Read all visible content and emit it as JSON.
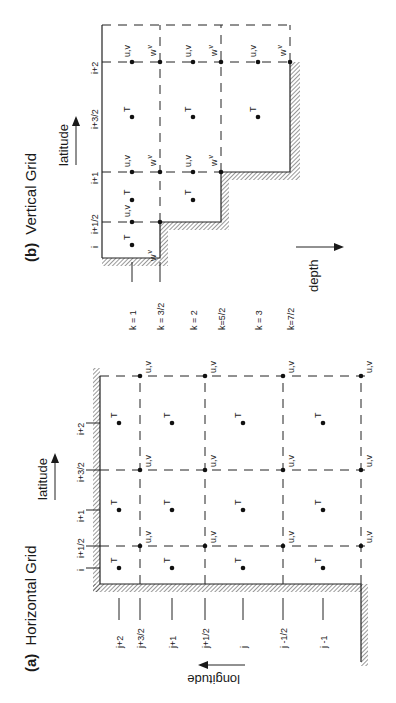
{
  "figure": {
    "orientation": "rotated 90 degrees counter-clockwise",
    "background_color": "#ffffff",
    "ink_color": "#1a1a1a"
  },
  "panel_a": {
    "label": "(a)",
    "title": "Horizontal Grid",
    "x_axis_label": "latitude",
    "y_axis_label": "longitude",
    "column_labels": [
      "i",
      "i+1/2",
      "i+1",
      "i+3/2",
      "i+2"
    ],
    "row_labels": [
      "j+2",
      "j+3/2",
      "j+1",
      "j+1/2",
      "j",
      "j -1/2",
      "j -1"
    ],
    "tracer_symbol": "T",
    "velocity_symbol": "u,v"
  },
  "panel_b": {
    "label": "(b)",
    "title": "Vertical Grid",
    "x_axis_label": "latitude",
    "depth_axis_label": "depth",
    "column_labels": [
      "i",
      "i+1/2",
      "i+1",
      "i+3/2",
      "i+2"
    ],
    "level_labels": [
      "k = 1",
      "k = 3/2",
      "k = 2",
      "k=5/2",
      "k = 3",
      "k=7/2"
    ],
    "tracer_symbol": "T",
    "velocity_symbol": "u,v",
    "vertical_velocity_symbol": "w",
    "vertical_velocity_superscript": "v"
  }
}
